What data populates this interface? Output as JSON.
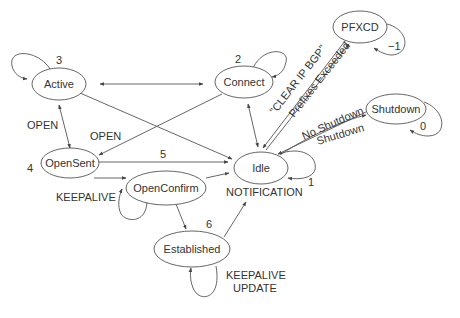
{
  "diagram": {
    "type": "state-machine",
    "states": [
      {
        "id": "active",
        "label": "Active",
        "number": "3"
      },
      {
        "id": "connect",
        "label": "Connect",
        "number": "2"
      },
      {
        "id": "pfxcd",
        "label": "PFXCD",
        "number": "−1"
      },
      {
        "id": "shutdown",
        "label": "Shutdown",
        "number": "0"
      },
      {
        "id": "idle",
        "label": "Idle",
        "number": "1"
      },
      {
        "id": "opensent",
        "label": "OpenSent",
        "number": "4"
      },
      {
        "id": "openconfirm",
        "label": "OpenConfirm",
        "number": "5"
      },
      {
        "id": "established",
        "label": "Established",
        "number": "6"
      }
    ],
    "edge_labels": {
      "active_opensent": "OPEN",
      "connect_opensent": "OPEN",
      "pfxcd_idle": "\"CLEAR IP BGP\"",
      "idle_pfxcd": "Prefixes Exceeded",
      "idle_shutdown": "No Shutdown",
      "shutdown_idle": "Shutdown",
      "openconfirm_loop": "KEEPALIVE",
      "to_idle_notification": "NOTIFICATION",
      "established_loop_1": "KEEPALIVE",
      "established_loop_2": "UPDATE"
    }
  }
}
